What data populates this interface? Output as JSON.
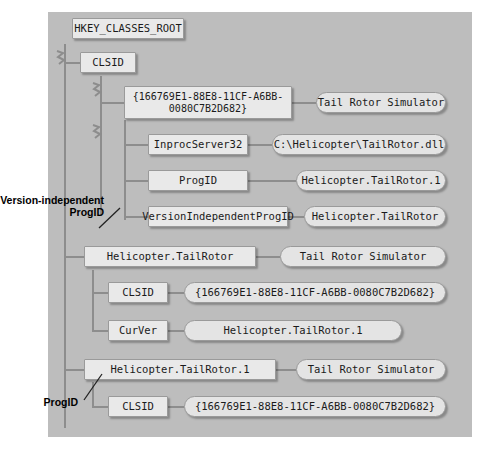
{
  "diagram": {
    "title_node": "HKEY_CLASSES_ROOT",
    "clsid_key": "CLSID",
    "guid_braced_multiline": "{166769E1-88E8-11CF-A6BB-\n0080C7B2D682}",
    "guid_braced": "{166769E1-88E8-11CF-A6BB-0080C7B2D682}",
    "tail_rotor_simulator": "Tail Rotor Simulator",
    "inprocserver32_key": "InprocServer32",
    "inprocserver32_value": "C:\\Helicopter\\TailRotor.dll",
    "progid_key": "ProgID",
    "progid_value": "Helicopter.TailRotor.1",
    "version_independent_progid_key": "VersionIndependentProgID",
    "version_independent_progid_value": "Helicopter.TailRotor",
    "helicopter_tailrotor_key": "Helicopter.TailRotor",
    "helicopter_tailrotor_clsid_key": "CLSID",
    "helicopter_tailrotor_clsid_value": "{166769E1-88E8-11CF-A6BB-0080C7B2D682}",
    "curver_key": "CurVer",
    "curver_value": "Helicopter.TailRotor.1",
    "helicopter_tailrotor_1_key": "Helicopter.TailRotor.1",
    "helicopter_tailrotor_1_clsid_key": "CLSID",
    "helicopter_tailrotor_1_clsid_value": "{166769E1-88E8-11CF-A6BB-0080C7B2D682}",
    "annotation_version_independent_progid": "Version-independent\nProgID",
    "annotation_progid": "ProgID",
    "colors": {
      "canvas": "#bdbdbd",
      "node_fill": "#e9e9e9",
      "node_border": "#9a9a9a",
      "line": "#8d8d8d",
      "text": "#1a1a1a"
    }
  }
}
